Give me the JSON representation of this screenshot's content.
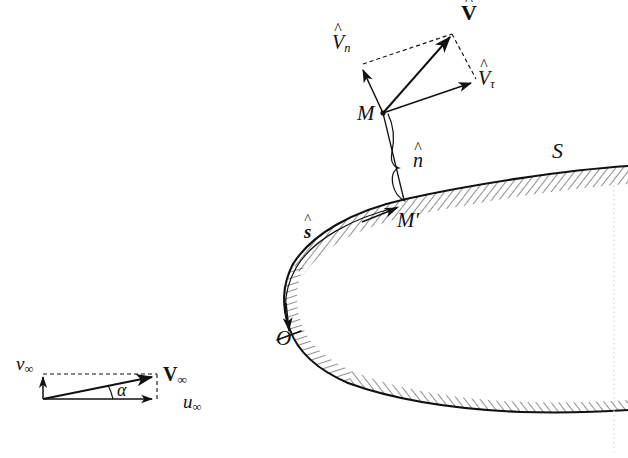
{
  "figure": {
    "domain": "diagram",
    "background_color": "#ffffff",
    "line_color": "#111111"
  },
  "labels": {
    "velocity_vector": "V",
    "velocity_vector_hat": "^",
    "normal_component": "V",
    "normal_component_sub": "n",
    "tangential_component": "V",
    "tangential_component_sub": "τ",
    "point_m": "M",
    "point_m_prime": "M′",
    "unit_normal": "n",
    "unit_normal_hat": "^",
    "arc_coordinate": "s",
    "arc_coordinate_hat": "^",
    "surface": "S",
    "origin": "O",
    "freestream": "V",
    "freestream_sub": "∞",
    "freestream_u": "u",
    "freestream_u_sub": "∞",
    "freestream_v": "v",
    "freestream_v_sub": "∞",
    "angle_of_attack": "α"
  },
  "geometry": {
    "point_M": {
      "x": 383,
      "y": 113
    },
    "point_M_prime": {
      "x": 404,
      "y": 200
    },
    "point_V_tip": {
      "x": 452,
      "y": 35
    },
    "point_Vn_tip": {
      "x": 362,
      "y": 68
    },
    "point_Vtau_tip": {
      "x": 474,
      "y": 82
    },
    "origin_O": {
      "x": 288,
      "y": 324
    },
    "freestream_origin": {
      "x": 43,
      "y": 399
    },
    "freestream_tip": {
      "x": 157,
      "y": 376
    },
    "freestream_u_tip": {
      "x": 157,
      "y": 399
    },
    "freestream_v_tip": {
      "x": 43,
      "y": 374
    }
  },
  "style": {
    "surface_stroke_width": 2.0,
    "vector_stroke_width": 1.4,
    "hatch_stroke_width": 0.9,
    "dash_pattern": "4,3",
    "dotted_edge_color": "#d9d9d9"
  }
}
